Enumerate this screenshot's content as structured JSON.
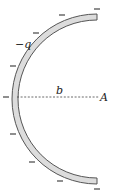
{
  "diagram": {
    "charge_label": "−q",
    "radius_label": "b",
    "point_label": "A",
    "charge_sign_symbol": "−",
    "arc": {
      "center": [
        97,
        99
      ],
      "outer_radius": 85,
      "inner_radius": 79,
      "fill_color": "#dcdcdc",
      "stroke_color": "#555555"
    },
    "minus_signs": [
      {
        "x": 97,
        "y": 9
      },
      {
        "x": 62,
        "y": 15
      },
      {
        "x": 36,
        "y": 32
      },
      {
        "x": 13,
        "y": 66
      },
      {
        "x": 6,
        "y": 97
      },
      {
        "x": 13,
        "y": 132
      },
      {
        "x": 32,
        "y": 162
      },
      {
        "x": 60,
        "y": 180
      },
      {
        "x": 97,
        "y": 188
      }
    ],
    "dashed_line": {
      "x1": 17,
      "y1": 97,
      "x2": 99,
      "y2": 97,
      "color": "#444444"
    }
  }
}
